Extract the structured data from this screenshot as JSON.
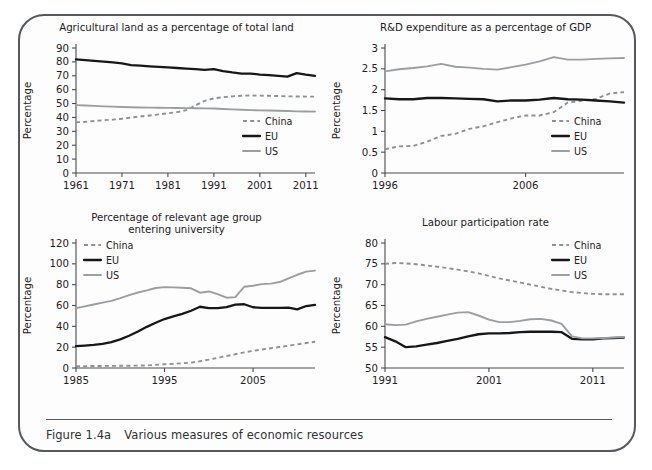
{
  "figure": {
    "caption_number": "Figure 1.4a",
    "caption_text": "Various measures of economic resources"
  },
  "legend_labels": {
    "china": "China",
    "eu": "EU",
    "us": "US"
  },
  "colors": {
    "china": "#8e9194",
    "eu": "#151719",
    "us": "#9b9ea1",
    "axis": "#4a4d50",
    "frame": "#55585c",
    "background": "#fdfdfd"
  },
  "chart_data": [
    {
      "id": "agricultural-land",
      "type": "line",
      "title": "Agricultural land as a percentage of total land",
      "xlabel": "",
      "ylabel": "Percentage",
      "xlim": [
        1961,
        2013
      ],
      "ylim": [
        0,
        90
      ],
      "yticks": [
        0,
        10,
        20,
        30,
        40,
        50,
        60,
        70,
        80,
        90
      ],
      "xticks": [
        1961,
        1971,
        1981,
        1991,
        2001,
        2011
      ],
      "grid": false,
      "legend_position": "inside-right",
      "x": [
        1961,
        1963,
        1965,
        1967,
        1969,
        1971,
        1973,
        1975,
        1977,
        1979,
        1981,
        1983,
        1985,
        1987,
        1989,
        1991,
        1993,
        1995,
        1997,
        1999,
        2001,
        2003,
        2005,
        2007,
        2009,
        2011,
        2013
      ],
      "series": [
        {
          "name": "China",
          "values": [
            36.5,
            36.8,
            37.4,
            38.0,
            38.4,
            39.1,
            39.9,
            40.7,
            41.4,
            42.2,
            43.0,
            43.8,
            45.2,
            48.8,
            52.0,
            53.7,
            54.6,
            55.2,
            55.6,
            55.8,
            55.7,
            55.6,
            55.4,
            55.2,
            55.1,
            55.0,
            55.0
          ]
        },
        {
          "name": "EU",
          "values": [
            81.8,
            81.3,
            80.8,
            80.2,
            79.6,
            78.9,
            77.6,
            77.3,
            76.8,
            76.4,
            76.0,
            75.6,
            75.2,
            74.8,
            74.3,
            74.8,
            73.4,
            72.4,
            71.6,
            71.6,
            70.9,
            70.5,
            70.0,
            69.4,
            71.9,
            70.8,
            70.0
          ]
        },
        {
          "name": "US",
          "values": [
            48.9,
            48.6,
            48.3,
            48.0,
            47.8,
            47.5,
            47.3,
            47.2,
            47.1,
            47.0,
            46.9,
            46.8,
            46.7,
            46.6,
            46.5,
            46.4,
            46.1,
            45.8,
            45.5,
            45.3,
            45.1,
            45.0,
            44.8,
            44.6,
            44.4,
            44.3,
            44.2
          ]
        }
      ]
    },
    {
      "id": "rnd-expenditure",
      "type": "line",
      "title": "R&D expenditure as a percentage of GDP",
      "xlabel": "",
      "ylabel": "Percentage",
      "xlim": [
        1996,
        2013
      ],
      "ylim": [
        0,
        3
      ],
      "yticks": [
        0,
        0.5,
        1,
        1.5,
        2,
        2.5,
        3
      ],
      "xticks": [
        1996,
        2006
      ],
      "grid": false,
      "legend_position": "inside-right",
      "x": [
        1996,
        1997,
        1998,
        1999,
        2000,
        2001,
        2002,
        2003,
        2004,
        2005,
        2006,
        2007,
        2008,
        2009,
        2010,
        2011,
        2012,
        2013
      ],
      "series": [
        {
          "name": "China",
          "values": [
            0.57,
            0.64,
            0.65,
            0.75,
            0.89,
            0.94,
            1.06,
            1.12,
            1.22,
            1.31,
            1.38,
            1.38,
            1.46,
            1.69,
            1.73,
            1.78,
            1.91,
            1.94
          ]
        },
        {
          "name": "EU",
          "values": [
            1.79,
            1.77,
            1.77,
            1.8,
            1.8,
            1.79,
            1.78,
            1.77,
            1.72,
            1.74,
            1.74,
            1.76,
            1.8,
            1.77,
            1.76,
            1.74,
            1.72,
            1.69
          ]
        },
        {
          "name": "US",
          "values": [
            2.44,
            2.49,
            2.52,
            2.56,
            2.62,
            2.55,
            2.53,
            2.5,
            2.48,
            2.54,
            2.6,
            2.68,
            2.78,
            2.72,
            2.72,
            2.74,
            2.75,
            2.76
          ]
        }
      ]
    },
    {
      "id": "university-entry",
      "type": "line",
      "title": "Percentage of relevant age group\nentering university",
      "title_line1": "Percentage of relevant age group",
      "title_line2": "entering university",
      "xlabel": "",
      "ylabel": "Percentage",
      "xlim": [
        1985,
        2012
      ],
      "ylim": [
        0,
        120
      ],
      "yticks": [
        0,
        20,
        40,
        60,
        80,
        100,
        120
      ],
      "xticks": [
        1985,
        1995,
        2005
      ],
      "grid": false,
      "legend_position": "inside-top-left",
      "x": [
        1985,
        1986,
        1987,
        1988,
        1989,
        1990,
        1991,
        1992,
        1993,
        1994,
        1995,
        1996,
        1997,
        1998,
        1999,
        2000,
        2001,
        2002,
        2003,
        2004,
        2005,
        2006,
        2007,
        2008,
        2009,
        2010,
        2011,
        2012
      ],
      "series": [
        {
          "name": "China",
          "values": [
            1.7,
            1.8,
            1.9,
            2.0,
            2.0,
            2.1,
            2.2,
            2.3,
            2.5,
            3.0,
            3.6,
            4.0,
            4.5,
            5.2,
            6.5,
            8.0,
            9.8,
            11.5,
            13.2,
            15.0,
            16.4,
            17.8,
            19.0,
            20.2,
            21.4,
            22.6,
            24.0,
            25.2
          ]
        },
        {
          "name": "EU",
          "values": [
            21.0,
            21.5,
            22.2,
            23.2,
            24.8,
            27.5,
            31.0,
            35.0,
            39.5,
            43.5,
            47.0,
            49.5,
            52.0,
            55.0,
            58.8,
            57.5,
            57.4,
            58.5,
            60.8,
            61.2,
            58.3,
            57.8,
            57.7,
            57.8,
            57.9,
            56.3,
            59.5,
            60.5
          ]
        },
        {
          "name": "US",
          "values": [
            57.5,
            59.2,
            61.0,
            62.8,
            64.5,
            67.0,
            70.0,
            72.5,
            74.5,
            76.8,
            77.6,
            77.4,
            77.0,
            76.5,
            72.3,
            73.5,
            71.0,
            67.5,
            68.0,
            78.0,
            79.0,
            80.5,
            81.0,
            82.5,
            86.0,
            89.5,
            92.5,
            93.5
          ]
        }
      ]
    },
    {
      "id": "labour-participation",
      "type": "line",
      "title": "Labour participation rate",
      "xlabel": "",
      "ylabel": "Percentage",
      "xlim": [
        1991,
        2014
      ],
      "ylim": [
        50,
        80
      ],
      "yticks": [
        50,
        55,
        60,
        65,
        70,
        75,
        80
      ],
      "xticks": [
        1991,
        2001,
        2011
      ],
      "grid": false,
      "legend_position": "inside-top-right",
      "x": [
        1991,
        1992,
        1993,
        1994,
        1995,
        1996,
        1997,
        1998,
        1999,
        2000,
        2001,
        2002,
        2003,
        2004,
        2005,
        2006,
        2007,
        2008,
        2009,
        2010,
        2011,
        2012,
        2013,
        2014
      ],
      "series": [
        {
          "name": "China",
          "values": [
            75.0,
            75.2,
            75.1,
            74.9,
            74.6,
            74.3,
            74.0,
            73.6,
            73.2,
            72.7,
            72.1,
            71.5,
            71.0,
            70.5,
            70.0,
            69.5,
            69.0,
            68.6,
            68.2,
            68.0,
            67.8,
            67.7,
            67.7,
            67.7
          ]
        },
        {
          "name": "EU",
          "values": [
            57.4,
            56.4,
            55.0,
            55.2,
            55.6,
            56.0,
            56.5,
            57.0,
            57.6,
            58.1,
            58.3,
            58.3,
            58.4,
            58.6,
            58.7,
            58.7,
            58.7,
            58.6,
            57.0,
            56.9,
            56.9,
            57.1,
            57.2,
            57.3
          ]
        },
        {
          "name": "US",
          "values": [
            60.5,
            60.3,
            60.4,
            61.2,
            61.8,
            62.3,
            62.8,
            63.3,
            63.4,
            62.6,
            61.6,
            61.0,
            61.0,
            61.3,
            61.7,
            61.8,
            61.4,
            60.6,
            57.6,
            57.1,
            57.1,
            57.2,
            57.3,
            57.4
          ]
        }
      ]
    }
  ]
}
